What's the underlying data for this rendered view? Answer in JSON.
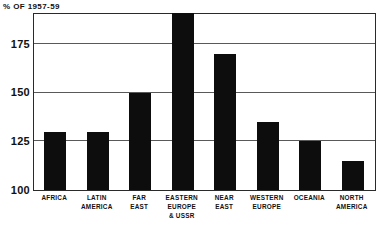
{
  "chart_data": {
    "type": "bar",
    "title": "% OF 1957-59",
    "subtitle": "",
    "xlabel": "",
    "ylabel": "% OF 1957-59",
    "ylim": [
      100,
      190
    ],
    "yticks": [
      100,
      125,
      150,
      175
    ],
    "ytick_labels": [
      "100",
      "125",
      "150",
      "175"
    ],
    "grid": true,
    "legend": null,
    "categories": [
      "AFRICA",
      "LATIN\nAMERICA",
      "FAR\nEAST",
      "EASTERN\nEUROPE\n& USSR",
      "NEAR\nEAST",
      "WESTERN\nEUROPE",
      "OCEANIA",
      "NORTH\nAMERICA"
    ],
    "values": [
      130,
      130,
      150,
      191,
      170,
      135,
      125,
      115
    ],
    "bar_color": "#0d0d0d",
    "annotations": []
  },
  "axis": {
    "title": "% OF 1957-59",
    "ticks": [
      {
        "label": "175",
        "value": 175
      },
      {
        "label": "150",
        "value": 150
      },
      {
        "label": "125",
        "value": 125
      },
      {
        "label": "100",
        "value": 100
      }
    ]
  },
  "bars": [
    {
      "label": "AFRICA",
      "value": 130
    },
    {
      "label": "LATIN\nAMERICA",
      "value": 130
    },
    {
      "label": "FAR\nEAST",
      "value": 150
    },
    {
      "label": "EASTERN\nEUROPE\n& USSR",
      "value": 191
    },
    {
      "label": "NEAR\nEAST",
      "value": 170
    },
    {
      "label": "WESTERN\nEUROPE",
      "value": 135
    },
    {
      "label": "OCEANIA",
      "value": 125
    },
    {
      "label": "NORTH\nAMERICA",
      "value": 115
    }
  ]
}
